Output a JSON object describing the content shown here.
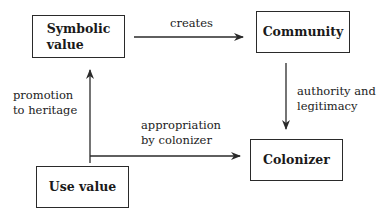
{
  "diagram": {
    "nodes": {
      "symbolic_value": {
        "line1": "Symbolic",
        "line2": "value"
      },
      "community": {
        "label": "Community"
      },
      "colonizer": {
        "label": "Colonizer"
      },
      "use_value": {
        "label": "Use value"
      }
    },
    "edges": {
      "creates": {
        "label": "creates",
        "from": "Symbolic value",
        "to": "Community"
      },
      "authority": {
        "line1": "authority and",
        "line2": "legitimacy",
        "from": "Community",
        "to": "Colonizer"
      },
      "promotion": {
        "line1": "promotion",
        "line2": "to heritage",
        "from": "Use value",
        "to": "Symbolic value"
      },
      "appropriation": {
        "line1": "appropriation",
        "line2": "by colonizer",
        "from": "Use value",
        "to": "Colonizer"
      }
    },
    "colors": {
      "stroke": "#2a2a2a",
      "text": "#1a1a1a",
      "background": "#ffffff"
    }
  }
}
